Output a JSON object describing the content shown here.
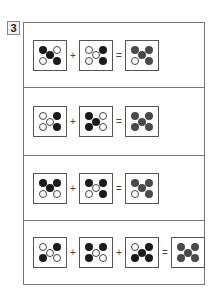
{
  "question_number": "3",
  "rows": [
    {
      "operators": [
        "+",
        "="
      ],
      "terms": [
        {
          "tl": "black",
          "tr": "white",
          "c": "black",
          "bl": "white",
          "br": "black"
        },
        {
          "tl": "white",
          "tr": "black",
          "c": "white",
          "bl": "white",
          "br": "black"
        }
      ],
      "result": {
        "tl": "gray",
        "tr": "gray",
        "c": "gray",
        "bl": "white",
        "br": "gray"
      }
    },
    {
      "operators": [
        "+",
        "="
      ],
      "terms": [
        {
          "tl": "white",
          "tr": "black",
          "c": "white",
          "bl": "white",
          "br": "black"
        },
        {
          "tl": "black",
          "tr": "white",
          "c": "black",
          "bl": "black",
          "br": "white"
        }
      ],
      "result": {
        "tl": "gray",
        "tr": "gray",
        "c": "gray",
        "bl": "gray",
        "br": "gray"
      }
    },
    {
      "operators": [
        "+",
        "="
      ],
      "terms": [
        {
          "tl": "black",
          "tr": "black",
          "c": "black",
          "bl": "white",
          "br": "white"
        },
        {
          "tl": "black",
          "tr": "black",
          "c": "white",
          "bl": "white",
          "br": "black"
        }
      ],
      "result": {
        "tl": "gray",
        "tr": "gray",
        "c": "gray",
        "bl": "white",
        "br": "gray"
      }
    },
    {
      "operators": [
        "+",
        "+",
        "="
      ],
      "terms": [
        {
          "tl": "white",
          "tr": "black",
          "c": "white",
          "bl": "black",
          "br": "white"
        },
        {
          "tl": "black",
          "tr": "black",
          "c": "white",
          "bl": "black",
          "br": "white"
        },
        {
          "tl": "white",
          "tr": "black",
          "c": "black",
          "bl": "black",
          "br": "black"
        }
      ],
      "result": {
        "tl": "gray",
        "tr": "gray",
        "c": "gray",
        "bl": "gray",
        "br": "gray"
      }
    }
  ]
}
